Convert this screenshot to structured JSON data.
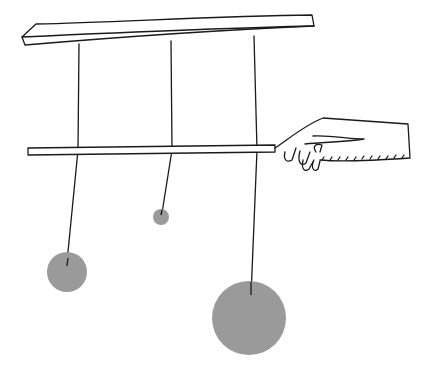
{
  "illustration": {
    "subject": "hanging mobile with three weights and a hand holding a rod",
    "colors": {
      "background": "#ffffff",
      "ink": "#1a1a1a",
      "weight": "#9a9a9a"
    },
    "weights": [
      {
        "name": "left-weight",
        "cx": 67,
        "cy": 272,
        "r": 20
      },
      {
        "name": "small-weight",
        "cx": 161,
        "cy": 217,
        "r": 8
      },
      {
        "name": "large-weight",
        "cx": 249,
        "cy": 318,
        "r": 37
      }
    ]
  }
}
